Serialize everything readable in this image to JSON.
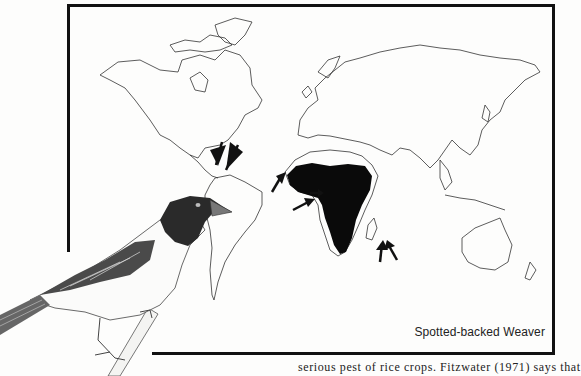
{
  "figure": {
    "type": "range-map",
    "caption": "Spotted-backed Weaver",
    "range_region": "Sub-Saharan Africa",
    "arrows": [
      {
        "label": "introduction-caribbean-1",
        "location": "Hispaniola"
      },
      {
        "label": "introduction-caribbean-2",
        "location": "Hispaniola"
      },
      {
        "label": "introduction-west-africa",
        "location": "Senegal coast"
      },
      {
        "label": "introduction-gulf-of-guinea",
        "location": "São Tomé"
      },
      {
        "label": "introduction-indian-ocean-1",
        "location": "Mascarene Islands"
      },
      {
        "label": "introduction-indian-ocean-2",
        "location": "Mascarene Islands"
      },
      {
        "label": "introduction-east-africa",
        "location": "Zanzibar"
      }
    ],
    "colors": {
      "frame": "#111111",
      "range_fill": "#0a0a0a",
      "coastline": "#333333"
    }
  },
  "illustration": {
    "subject": "Spotted-backed Weaver bird perched on branch"
  },
  "text": {
    "line_fragment": "serious pest of rice crops. Fitzwater (1971) says that"
  }
}
